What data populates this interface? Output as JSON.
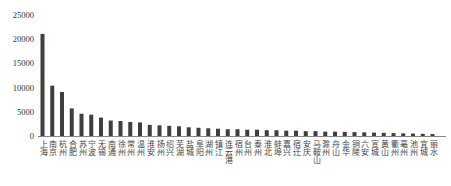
{
  "chart_data": {
    "type": "bar",
    "title": "",
    "xlabel": "",
    "ylabel": "",
    "ylim": [
      0,
      25000
    ],
    "yticks": [
      0,
      5000,
      10000,
      15000,
      20000,
      25000
    ],
    "grid": false,
    "legend": null,
    "bar_color": "#3f3f3f",
    "categories": [
      "上海",
      "南京",
      "杭州",
      "合肥",
      "苏州",
      "宁波",
      "无锡",
      "南通",
      "徐州",
      "常州",
      "温州",
      "淮安",
      "扬州",
      "绍兴",
      "芜湖",
      "盐城",
      "阜阳",
      "湖州",
      "镇江",
      "连云港",
      "宿州",
      "台州",
      "泰州",
      "淮北",
      "蚌埠",
      "嘉兴",
      "宿迁",
      "安庆",
      "马鞍山",
      "滁州",
      "舟山",
      "金华",
      "铜陵",
      "六安",
      "宣城",
      "黄山",
      "衢州",
      "亳州",
      "池州",
      "宜城",
      "丽水"
    ],
    "values": [
      21100,
      10400,
      9100,
      5700,
      4600,
      4400,
      3800,
      3200,
      3100,
      2900,
      2800,
      2300,
      2200,
      2100,
      2000,
      1800,
      1700,
      1600,
      1500,
      1400,
      1400,
      1300,
      1300,
      1200,
      1200,
      1100,
      1100,
      1000,
      1000,
      900,
      900,
      850,
      800,
      750,
      700,
      650,
      600,
      550,
      500,
      450,
      400
    ]
  }
}
